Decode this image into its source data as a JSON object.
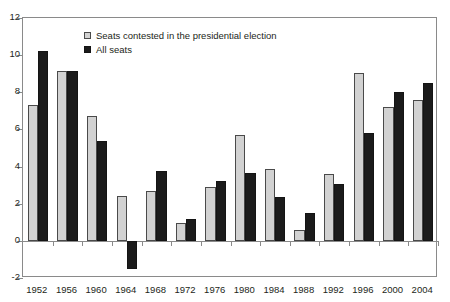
{
  "figure": {
    "top_sliver_text": "",
    "background": "#ffffff"
  },
  "legend": {
    "position": "top-center-left",
    "entries": [
      {
        "label": "Seats contested in the presidential election",
        "color": "#d2d2d2",
        "swatch": "light-square-swatch"
      },
      {
        "label": "All seats",
        "color": "#1b1b1b",
        "swatch": "dark-square-swatch"
      }
    ]
  },
  "axes": {
    "y_ticks": [
      "12",
      "10",
      "8",
      "6",
      "4",
      "2",
      "0",
      "-2"
    ],
    "x_ticks": [
      "1952",
      "1956",
      "1960",
      "1964",
      "1968",
      "1972",
      "1976",
      "1980",
      "1984",
      "1988",
      "1992",
      "1996",
      "2000",
      "2004"
    ]
  },
  "chart_data": {
    "type": "bar",
    "title": "",
    "subtitle": "",
    "xlabel": "",
    "ylabel": "",
    "ylim": [
      -2,
      12
    ],
    "ytick_step": 2,
    "grid": false,
    "legend_position": "top-center",
    "categories": [
      "1952",
      "1956",
      "1960",
      "1964",
      "1968",
      "1972",
      "1976",
      "1980",
      "1984",
      "1988",
      "1992",
      "1996",
      "2000",
      "2004"
    ],
    "series": [
      {
        "name": "Seats contested in the presidential election",
        "color": "#d2d2d2",
        "values": [
          7.3,
          9.15,
          6.7,
          2.4,
          2.7,
          0.95,
          2.9,
          5.7,
          3.85,
          0.6,
          3.6,
          9.05,
          7.2,
          7.6
        ]
      },
      {
        "name": "All seats",
        "color": "#1b1b1b",
        "values": [
          10.2,
          9.15,
          5.4,
          -1.5,
          3.75,
          1.2,
          3.2,
          3.65,
          2.35,
          1.5,
          3.05,
          5.8,
          8.0,
          8.5
        ]
      }
    ],
    "annotations": []
  }
}
